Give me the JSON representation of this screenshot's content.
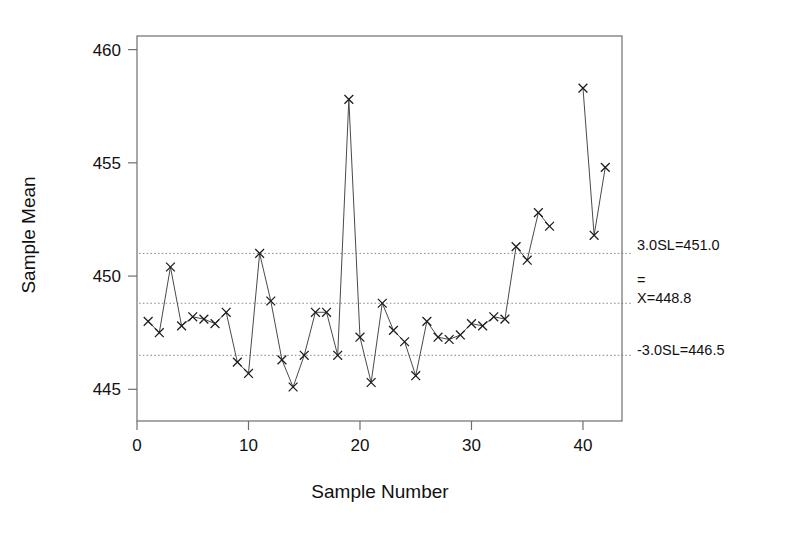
{
  "chart_data": {
    "type": "line",
    "title": "",
    "subtitle": "",
    "xlabel": "Sample Number",
    "ylabel": "Sample Mean",
    "xlim": [
      0,
      43.5
    ],
    "ylim": [
      443.6,
      460.6
    ],
    "xticks": [
      0,
      10,
      20,
      30,
      40
    ],
    "xtick_labels": [
      "0",
      "10",
      "20",
      "30",
      "40"
    ],
    "yticks": [
      445,
      450,
      455,
      460
    ],
    "ytick_labels": [
      "445",
      "450",
      "455",
      "460"
    ],
    "grid": false,
    "legend": false,
    "marker": "x",
    "x": [
      1,
      2,
      3,
      4,
      5,
      6,
      7,
      8,
      9,
      10,
      11,
      12,
      13,
      14,
      15,
      16,
      17,
      18,
      19,
      20,
      21,
      22,
      23,
      24,
      25,
      26,
      27,
      28,
      29,
      30,
      31,
      32,
      33,
      34,
      35,
      36,
      37,
      40,
      41,
      42
    ],
    "values": [
      448.0,
      447.5,
      450.4,
      447.8,
      448.2,
      448.1,
      447.9,
      448.4,
      446.2,
      445.7,
      451.0,
      448.9,
      446.3,
      445.1,
      446.5,
      448.4,
      448.4,
      446.5,
      457.8,
      447.3,
      445.3,
      448.8,
      447.6,
      447.1,
      445.6,
      448.0,
      447.3,
      447.2,
      447.4,
      447.9,
      447.8,
      448.2,
      448.1,
      451.3,
      450.7,
      452.8,
      452.2,
      458.3,
      451.8,
      454.8
    ],
    "series": [
      {
        "name": "Sample Mean",
        "points": [
          {
            "x": 1,
            "y": 448.0
          },
          {
            "x": 2,
            "y": 447.5
          },
          {
            "x": 3,
            "y": 450.4
          },
          {
            "x": 4,
            "y": 447.8
          },
          {
            "x": 5,
            "y": 448.2
          },
          {
            "x": 6,
            "y": 448.1
          },
          {
            "x": 7,
            "y": 447.9
          },
          {
            "x": 8,
            "y": 448.4
          },
          {
            "x": 9,
            "y": 446.2
          },
          {
            "x": 10,
            "y": 445.7
          },
          {
            "x": 11,
            "y": 451.0
          },
          {
            "x": 12,
            "y": 448.9
          },
          {
            "x": 13,
            "y": 446.3
          },
          {
            "x": 14,
            "y": 445.1
          },
          {
            "x": 15,
            "y": 446.5
          },
          {
            "x": 16,
            "y": 448.4
          },
          {
            "x": 17,
            "y": 448.4
          },
          {
            "x": 18,
            "y": 446.5
          },
          {
            "x": 19,
            "y": 457.8
          },
          {
            "x": 20,
            "y": 447.3
          },
          {
            "x": 21,
            "y": 445.3
          },
          {
            "x": 22,
            "y": 448.8
          },
          {
            "x": 23,
            "y": 447.6
          },
          {
            "x": 24,
            "y": 447.1
          },
          {
            "x": 25,
            "y": 445.6
          },
          {
            "x": 26,
            "y": 448.0
          },
          {
            "x": 27,
            "y": 447.3
          },
          {
            "x": 28,
            "y": 447.2
          },
          {
            "x": 29,
            "y": 447.4
          },
          {
            "x": 30,
            "y": 447.9
          },
          {
            "x": 31,
            "y": 447.8
          },
          {
            "x": 32,
            "y": 448.2
          },
          {
            "x": 33,
            "y": 448.1
          },
          {
            "x": 34,
            "y": 451.3
          },
          {
            "x": 35,
            "y": 450.7
          },
          {
            "x": 36,
            "y": 452.8
          },
          {
            "x": 37,
            "y": 452.2
          },
          {
            "x": 40,
            "y": 458.3
          },
          {
            "x": 41,
            "y": 451.8
          },
          {
            "x": 42,
            "y": 454.8
          }
        ]
      }
    ],
    "control_limits": [
      {
        "id": "ucl",
        "value": 451.0,
        "label": "3.0SL=451.0",
        "style": "dotted"
      },
      {
        "id": "center",
        "value": 448.8,
        "label": "X=448.8",
        "overbar": "=",
        "style": "dotted"
      },
      {
        "id": "lcl",
        "value": 446.5,
        "label": "-3.0SL=446.5",
        "style": "dotted"
      }
    ],
    "annotations": [
      {
        "id": "ucl-annotation",
        "text": "3.0SL=451.0"
      },
      {
        "id": "center-overbar",
        "text": "="
      },
      {
        "id": "center-annotation",
        "text": "X=448.8"
      },
      {
        "id": "lcl-annotation",
        "text": "-3.0SL=446.5"
      }
    ],
    "colors": {
      "background": "#ffffff",
      "frame": "#6e6e6e",
      "series": "#4a4a4a",
      "marker": "#1c1c1c",
      "limit": "#8a8a8a",
      "text": "#111111"
    }
  }
}
